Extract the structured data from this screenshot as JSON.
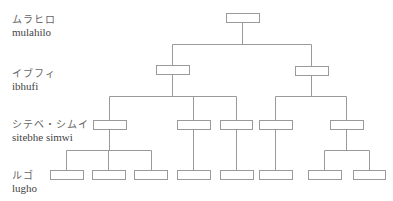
{
  "levels": [
    {
      "kana": "ムラヒロ",
      "roman": "mulahilo"
    },
    {
      "kana": "イブフィ",
      "roman": "ibhufi"
    },
    {
      "kana": "シテベ・シムイ",
      "roman": "sitebhe simwi"
    },
    {
      "kana": "ルゴ",
      "roman": "lugho"
    }
  ],
  "tree": {
    "root": "mulahilo",
    "children": [
      {
        "name": "ibhufi-1",
        "children": [
          {
            "name": "sitebhe-1",
            "children": [
              "lugho-1",
              "lugho-2",
              "lugho-3"
            ]
          },
          {
            "name": "sitebhe-2",
            "children": [
              "lugho-4"
            ]
          },
          {
            "name": "sitebhe-3",
            "children": [
              "lugho-5"
            ]
          }
        ]
      },
      {
        "name": "ibhufi-2",
        "children": [
          {
            "name": "sitebhe-4",
            "children": [
              "lugho-6"
            ]
          },
          {
            "name": "sitebhe-5",
            "children": [
              "lugho-7",
              "lugho-8"
            ]
          }
        ]
      }
    ]
  }
}
